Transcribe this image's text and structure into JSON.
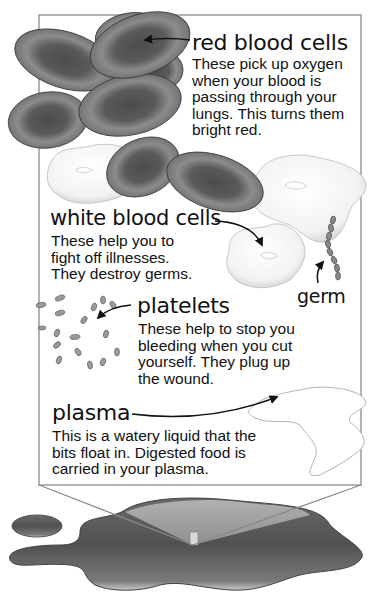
{
  "diagram": {
    "sections": {
      "red_blood_cells": {
        "heading": "red blood cells",
        "lines": [
          "These pick up oxygen",
          "when your blood is",
          "passing through your",
          "lungs. This turns them",
          "bright red."
        ]
      },
      "white_blood_cells": {
        "heading": "white blood cells",
        "lines": [
          "These help you to",
          "fight off illnesses.",
          "They destroy germs."
        ]
      },
      "germ": {
        "heading": "germ"
      },
      "platelets": {
        "heading": "platelets",
        "lines": [
          "These help to stop you",
          "bleeding when you cut",
          "yourself. They plug up",
          "the wound."
        ]
      },
      "plasma": {
        "heading": "plasma",
        "lines": [
          "This is a watery liquid that the",
          "bits float in. Digested food is",
          "carried in your plasma."
        ]
      }
    },
    "colors": {
      "frame": "#8a8a8a",
      "red_cell_dark": "#4a4a4a",
      "red_cell_light": "#9a9a9a",
      "white_cell": "#f4f4f4",
      "puddle_dark": "#444444",
      "puddle_light": "#a8a8a8",
      "text": "#111111"
    }
  }
}
